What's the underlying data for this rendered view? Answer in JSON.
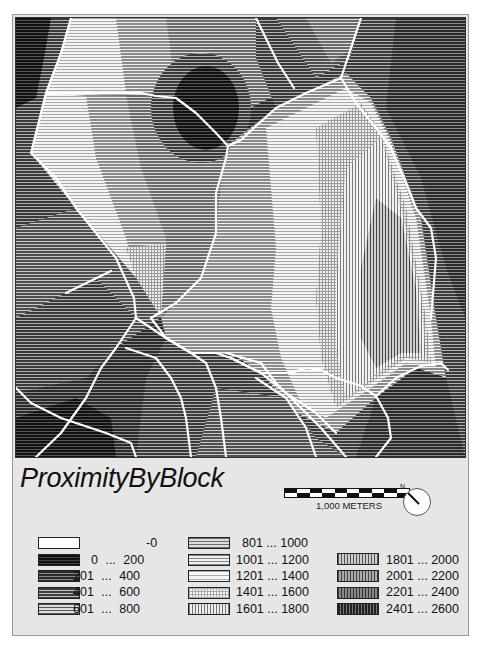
{
  "map": {
    "title": "ProximityByBlock",
    "scale_bar": {
      "label": "1,000 METERS",
      "segments": 10
    },
    "north_arrow": {
      "label": "N"
    }
  },
  "legend": {
    "columns": [
      [
        {
          "label": "-0",
          "fill": "#ffffff",
          "pattern": "none"
        },
        {
          "label": "0 ... 200",
          "fill": "#1a1a1a",
          "pattern": "h-dense-dark"
        },
        {
          "label": "201 ... 400",
          "fill": "#3a3a3a",
          "pattern": "h-dark"
        },
        {
          "label": "401 ... 600",
          "fill": "#5a5a5a",
          "pattern": "h-mid"
        },
        {
          "label": "601 ... 800",
          "fill": "#707070",
          "pattern": "h-mid-light"
        }
      ],
      [
        {
          "label": "801 ... 1000",
          "fill": "#888888",
          "pattern": "h-light"
        },
        {
          "label": "1001 ... 1200",
          "fill": "#9e9e9e",
          "pattern": "h-lighter"
        },
        {
          "label": "1201 ... 1400",
          "fill": "#b8b8b8",
          "pattern": "h-lightest"
        },
        {
          "label": "1401 ... 1600",
          "fill": "#c8c8c8",
          "pattern": "grid"
        },
        {
          "label": "1601 ... 1800",
          "fill": "#bdbdbd",
          "pattern": "v-light"
        }
      ],
      [
        {
          "label": "1801 ... 2000",
          "fill": "#8c8c8c",
          "pattern": "v-mid"
        },
        {
          "label": "2001 ... 2200",
          "fill": "#6e6e6e",
          "pattern": "v-dark"
        },
        {
          "label": "2201 ... 2400",
          "fill": "#555555",
          "pattern": "v-darker"
        },
        {
          "label": "2401 ... 2600",
          "fill": "#3c3c3c",
          "pattern": "v-darkest"
        }
      ]
    ]
  }
}
